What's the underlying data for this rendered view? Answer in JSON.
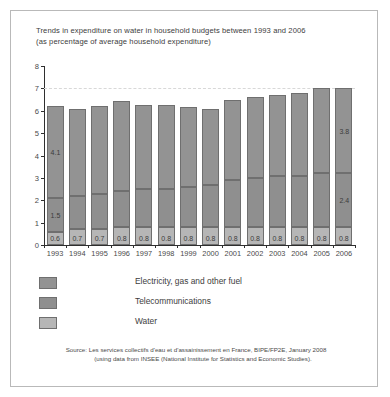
{
  "figure": {
    "title_line1": "Trends in expenditure on water in household budgets between 1993 and 2006",
    "title_line2": "(as percentage of average household expenditure)",
    "source_line1": "Source: Les services collectifs d'eau et d'assainissement en France, BIPE/FP2E, January 2008",
    "source_line2": "(using data from INSEE (National Institute for Statistics and Economic Studies)."
  },
  "legend": {
    "items": [
      {
        "label": "Electricity, gas and other fuel",
        "color": "#939393",
        "key": "electricity"
      },
      {
        "label": "Telecommunications",
        "color": "#8f8f8f",
        "key": "telecommunications"
      },
      {
        "label": "Water",
        "color": "#b6b6b6",
        "key": "water"
      }
    ]
  },
  "chart_data": {
    "type": "bar",
    "stacked": true,
    "title": "Trends in expenditure on water in household budgets between 1993 and 2006 (as percentage of average household expenditure)",
    "xlabel": "",
    "ylabel": "",
    "ylim": [
      0,
      8
    ],
    "yticks": [
      0,
      1,
      2,
      3,
      4,
      5,
      6,
      7,
      8
    ],
    "grid": "dashed-horizontal",
    "legend_position": "below-plot-left",
    "categories": [
      "1993",
      "1994",
      "1995",
      "1996",
      "1997",
      "1998",
      "1999",
      "2000",
      "2001",
      "2002",
      "2003",
      "2004",
      "2005",
      "2006"
    ],
    "series": [
      {
        "name": "Water",
        "color": "#b6b6b6",
        "values": [
          0.6,
          0.7,
          0.7,
          0.8,
          0.8,
          0.8,
          0.8,
          0.8,
          0.8,
          0.8,
          0.8,
          0.8,
          0.8,
          0.8
        ],
        "labels": [
          "0.6",
          "0.7",
          "0.7",
          "0.8",
          "0.8",
          "0.8",
          "0.8",
          "0.8",
          "0.8",
          "0.8",
          "0.8",
          "0.8",
          "0.8",
          "0.8"
        ]
      },
      {
        "name": "Telecommunications",
        "color": "#8f8f8f",
        "values": [
          1.5,
          1.5,
          1.6,
          1.6,
          1.7,
          1.7,
          1.8,
          1.9,
          2.1,
          2.2,
          2.3,
          2.3,
          2.4,
          2.4
        ],
        "labels": [
          "1.5",
          "",
          "",
          "",
          "",
          "",
          "",
          "",
          "",
          "",
          "",
          "",
          "",
          "2.4"
        ]
      },
      {
        "name": "Electricity, gas and other fuel",
        "color": "#939393",
        "values": [
          4.1,
          3.9,
          3.9,
          4.05,
          3.75,
          3.75,
          3.55,
          3.4,
          3.6,
          3.6,
          3.6,
          3.7,
          3.8,
          3.8
        ],
        "labels": [
          "4.1",
          "",
          "",
          "",
          "",
          "",
          "",
          "",
          "",
          "",
          "",
          "",
          "",
          "3.8"
        ]
      }
    ],
    "totals": [
      6.2,
      6.1,
      6.2,
      6.45,
      6.25,
      6.25,
      6.15,
      6.1,
      6.5,
      6.6,
      6.7,
      6.8,
      7.0,
      7.0
    ]
  }
}
